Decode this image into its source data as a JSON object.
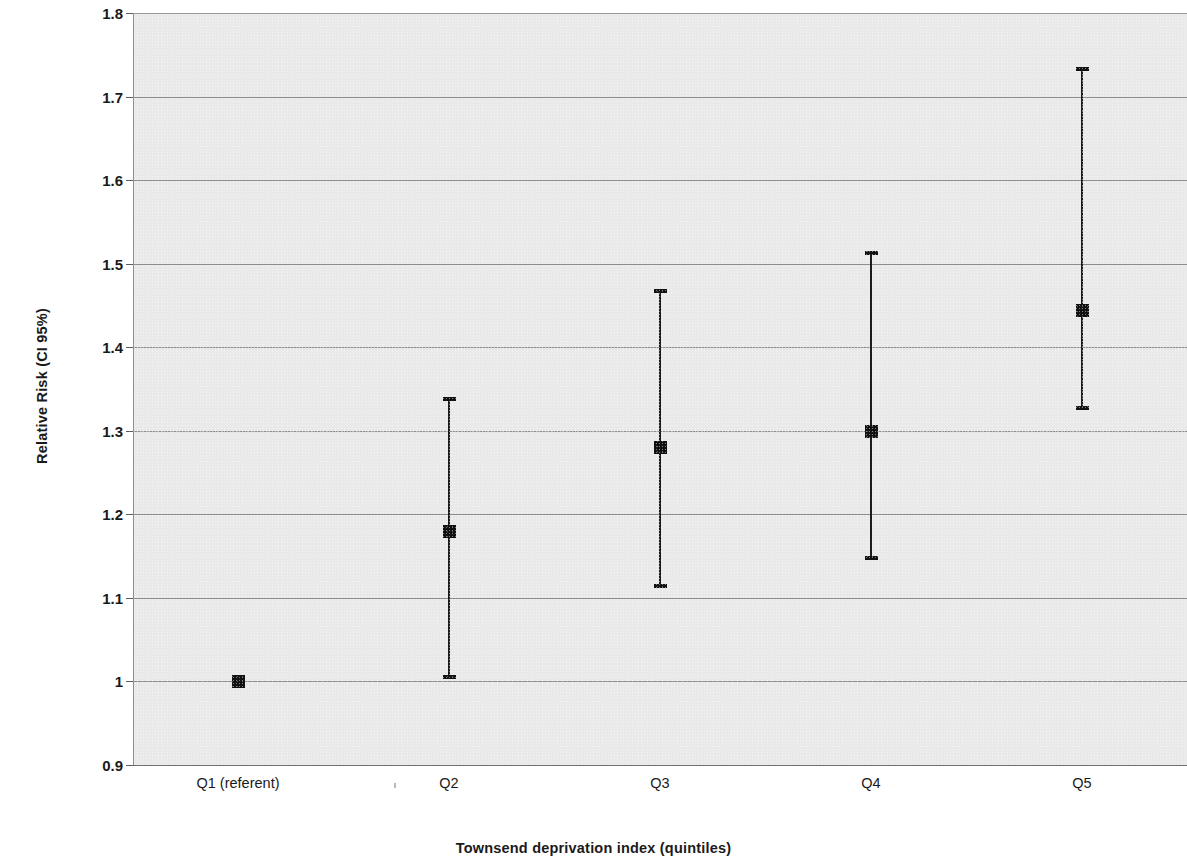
{
  "chart_data": {
    "type": "scatter",
    "title": "",
    "xlabel": "Townsend deprivation index (quintiles)",
    "ylabel": "Relative Risk (CI 95%)",
    "categories": [
      "Q1 (referent)",
      "Q2",
      "Q3",
      "Q4",
      "Q5"
    ],
    "values": [
      1.0,
      1.18,
      1.28,
      1.3,
      1.445
    ],
    "ci_lower": [
      1.0,
      1.003,
      1.112,
      1.145,
      1.325
    ],
    "ci_upper": [
      1.0,
      1.34,
      1.47,
      1.515,
      1.735
    ],
    "ylim": [
      0.9,
      1.8
    ],
    "yticks": [
      0.9,
      1.0,
      1.1,
      1.2,
      1.3,
      1.4,
      1.5,
      1.6,
      1.7,
      1.8
    ],
    "ytick_labels": [
      "0.9",
      "1",
      "1.1",
      "1.2",
      "1.3",
      "1.4",
      "1.5",
      "1.6",
      "1.7",
      "1.8"
    ],
    "grid": true,
    "legend": "none",
    "series": [
      {
        "name": "Relative Risk",
        "points": [
          {
            "category": "Q1 (referent)",
            "value": 1.0,
            "ci_low": 1.0,
            "ci_high": 1.0
          },
          {
            "category": "Q2",
            "value": 1.18,
            "ci_low": 1.003,
            "ci_high": 1.34
          },
          {
            "category": "Q3",
            "value": 1.28,
            "ci_low": 1.112,
            "ci_high": 1.47
          },
          {
            "category": "Q4",
            "value": 1.3,
            "ci_low": 1.145,
            "ci_high": 1.515
          },
          {
            "category": "Q5",
            "value": 1.445,
            "ci_low": 1.325,
            "ci_high": 1.735
          }
        ]
      }
    ],
    "colors": {
      "marker": "#111111",
      "whisker": "#1b1b1b",
      "plot_background": "#e9e9e9",
      "gridline": "#8d8d8d",
      "axis": "#6f6f6f",
      "text": "#1a1a1a"
    }
  }
}
